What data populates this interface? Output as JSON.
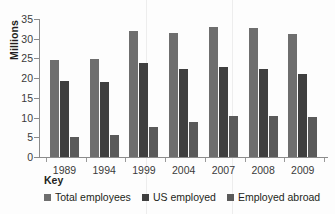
{
  "chart_data": {
    "type": "bar",
    "title": "",
    "subtitle": "",
    "xlabel": "",
    "ylabel": "Millions",
    "categories": [
      "1989",
      "1994",
      "1999",
      "2004",
      "2007",
      "2008",
      "2009"
    ],
    "series": [
      {
        "name": "Total employees",
        "color": "#6e6e6e",
        "values": [
          24.7,
          24.8,
          31.9,
          31.5,
          33.1,
          32.7,
          31.2
        ]
      },
      {
        "name": "US employed",
        "color": "#3f3f3f",
        "values": [
          19.4,
          19.1,
          23.9,
          22.3,
          22.8,
          22.2,
          21.0
        ]
      },
      {
        "name": "Employed abroad",
        "color": "#5a5a5a",
        "values": [
          5.0,
          5.5,
          7.6,
          8.8,
          10.4,
          10.4,
          10.2
        ]
      }
    ],
    "ylim": [
      0,
      35
    ],
    "yticks": [
      0,
      5,
      10,
      15,
      20,
      25,
      30,
      35
    ],
    "ytick_labels": [
      "0",
      "5",
      "10",
      "15",
      "20",
      "25",
      "30",
      "35"
    ],
    "grid": false,
    "legend_position": "bottom-left",
    "legend_title": "Key"
  },
  "legend": {
    "title": "Key",
    "items": [
      {
        "label": "Total employees"
      },
      {
        "label": "US employed"
      },
      {
        "label": "Employed abroad"
      }
    ]
  }
}
